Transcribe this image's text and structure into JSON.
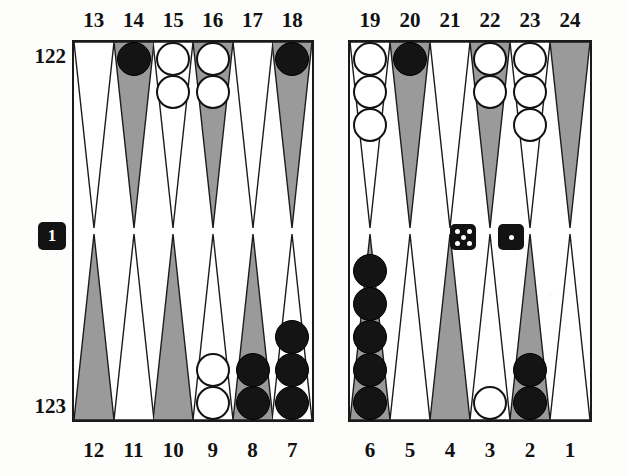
{
  "board": {
    "title": "Backgammon position diagram",
    "pip_counts": {
      "top_label": "122",
      "bottom_label": "123"
    },
    "point_labels_top": [
      "13",
      "14",
      "15",
      "16",
      "17",
      "18",
      "19",
      "20",
      "21",
      "22",
      "23",
      "24"
    ],
    "point_labels_bottom": [
      "12",
      "11",
      "10",
      "9",
      "8",
      "7",
      "6",
      "5",
      "4",
      "3",
      "2",
      "1"
    ],
    "colors": {
      "dark_point": "#9a9a9a",
      "light_point": "#ffffff",
      "black_checker": "#141414",
      "white_checker": "#ffffff",
      "border": "#1a1a1a",
      "die_body": "#121212",
      "die_pip": "#ffffff",
      "cube_body": "#131313"
    },
    "points": [
      {
        "number": "13",
        "row": "top",
        "quadrant": "left",
        "slot": 0,
        "shade": "light",
        "checkers": 0,
        "color": "none"
      },
      {
        "number": "14",
        "row": "top",
        "quadrant": "left",
        "slot": 1,
        "shade": "dark",
        "checkers": 1,
        "color": "black"
      },
      {
        "number": "15",
        "row": "top",
        "quadrant": "left",
        "slot": 2,
        "shade": "light",
        "checkers": 2,
        "color": "white"
      },
      {
        "number": "16",
        "row": "top",
        "quadrant": "left",
        "slot": 3,
        "shade": "dark",
        "checkers": 2,
        "color": "white"
      },
      {
        "number": "17",
        "row": "top",
        "quadrant": "left",
        "slot": 4,
        "shade": "light",
        "checkers": 0,
        "color": "none"
      },
      {
        "number": "18",
        "row": "top",
        "quadrant": "left",
        "slot": 5,
        "shade": "dark",
        "checkers": 1,
        "color": "black"
      },
      {
        "number": "19",
        "row": "top",
        "quadrant": "right",
        "slot": 0,
        "shade": "light",
        "checkers": 3,
        "color": "white"
      },
      {
        "number": "20",
        "row": "top",
        "quadrant": "right",
        "slot": 1,
        "shade": "dark",
        "checkers": 1,
        "color": "black"
      },
      {
        "number": "21",
        "row": "top",
        "quadrant": "right",
        "slot": 2,
        "shade": "light",
        "checkers": 0,
        "color": "none"
      },
      {
        "number": "22",
        "row": "top",
        "quadrant": "right",
        "slot": 3,
        "shade": "dark",
        "checkers": 2,
        "color": "white"
      },
      {
        "number": "23",
        "row": "top",
        "quadrant": "right",
        "slot": 4,
        "shade": "light",
        "checkers": 3,
        "color": "white"
      },
      {
        "number": "24",
        "row": "top",
        "quadrant": "right",
        "slot": 5,
        "shade": "dark",
        "checkers": 0,
        "color": "none"
      },
      {
        "number": "12",
        "row": "bottom",
        "quadrant": "left",
        "slot": 0,
        "shade": "dark",
        "checkers": 0,
        "color": "none"
      },
      {
        "number": "11",
        "row": "bottom",
        "quadrant": "left",
        "slot": 1,
        "shade": "light",
        "checkers": 0,
        "color": "none"
      },
      {
        "number": "10",
        "row": "bottom",
        "quadrant": "left",
        "slot": 2,
        "shade": "dark",
        "checkers": 0,
        "color": "none"
      },
      {
        "number": "9",
        "row": "bottom",
        "quadrant": "left",
        "slot": 3,
        "shade": "light",
        "checkers": 2,
        "color": "white"
      },
      {
        "number": "8",
        "row": "bottom",
        "quadrant": "left",
        "slot": 4,
        "shade": "dark",
        "checkers": 2,
        "color": "black"
      },
      {
        "number": "7",
        "row": "bottom",
        "quadrant": "left",
        "slot": 5,
        "shade": "light",
        "checkers": 3,
        "color": "black"
      },
      {
        "number": "6",
        "row": "bottom",
        "quadrant": "right",
        "slot": 0,
        "shade": "dark",
        "checkers": 5,
        "color": "black"
      },
      {
        "number": "5",
        "row": "bottom",
        "quadrant": "right",
        "slot": 1,
        "shade": "light",
        "checkers": 0,
        "color": "none"
      },
      {
        "number": "4",
        "row": "bottom",
        "quadrant": "right",
        "slot": 2,
        "shade": "dark",
        "checkers": 0,
        "color": "none"
      },
      {
        "number": "3",
        "row": "bottom",
        "quadrant": "right",
        "slot": 3,
        "shade": "light",
        "checkers": 1,
        "color": "white"
      },
      {
        "number": "2",
        "row": "bottom",
        "quadrant": "right",
        "slot": 4,
        "shade": "dark",
        "checkers": 2,
        "color": "black"
      },
      {
        "number": "1",
        "row": "bottom",
        "quadrant": "right",
        "slot": 5,
        "shade": "light",
        "checkers": 0,
        "color": "none"
      }
    ],
    "dice": [
      {
        "name": "die-left",
        "value": 5,
        "x": 450,
        "y": 224
      },
      {
        "name": "die-right",
        "value": 1,
        "x": 498,
        "y": 224
      }
    ],
    "doubling_cube": {
      "value": "1",
      "x": 38,
      "y": 222
    }
  }
}
